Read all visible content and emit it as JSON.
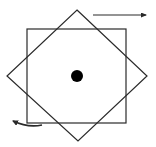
{
  "diagram": {
    "width": 156,
    "height": 147,
    "background": "#ffffff",
    "stroke_color": "#2a2a2a",
    "fill_color": "#000000",
    "upright_square": {
      "x": 27,
      "y": 29,
      "width": 99,
      "height": 94,
      "stroke_width": 1.2
    },
    "rotated_square": {
      "points": "77,10 147,76 78,141 7,76",
      "stroke_width": 1.2
    },
    "center_dot": {
      "cx": 77,
      "cy": 76,
      "r": 6
    },
    "arrow_top_right": {
      "x1": 93,
      "y1": 15,
      "x2": 146,
      "y2": 15,
      "direction": "right"
    },
    "arrow_bottom_left": {
      "path": "M42,125 Q28,128 13,121",
      "direction": "left"
    }
  }
}
